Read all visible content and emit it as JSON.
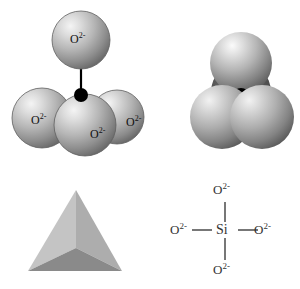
{
  "figure": {
    "width": 300,
    "height": 289,
    "background_color": "#ffffff"
  },
  "colors": {
    "sphere_highlight": "#f0f0f0",
    "sphere_mid": "#b8b8b8",
    "sphere_edge": "#6e6e6e",
    "sphere_outline": "#5a5a5a",
    "silicon_dot": "#000000",
    "bond_line": "#000000",
    "tetra_face_left": "#c4c4c4",
    "tetra_face_right": "#b0b0b0",
    "tetra_face_front": "#8a8a8a",
    "lewis_line": "#555555",
    "lewis_text": "#333333",
    "atom_label_text": "#111111"
  },
  "panels": {
    "ball_and_stick": {
      "name": "ball-and-stick model",
      "center_atom": "Si",
      "atoms": [
        {
          "id": "o-top",
          "label": "O",
          "charge": "2-",
          "cx": 81,
          "cy": 40,
          "r": 29
        },
        {
          "id": "o-left",
          "label": "O",
          "charge": "2-",
          "cx": 42,
          "cy": 118,
          "r": 30
        },
        {
          "id": "o-right",
          "label": "O",
          "charge": "2-",
          "cx": 117,
          "cy": 117,
          "r": 27
        },
        {
          "id": "o-front",
          "label": "O",
          "charge": "2-",
          "cx": 85,
          "cy": 125,
          "r": 31
        }
      ],
      "silicon": {
        "cx": 81,
        "cy": 95,
        "r": 7
      },
      "bond_count": 4
    },
    "space_filling": {
      "name": "space-filling model",
      "atoms": [
        {
          "id": "sf-top",
          "cx": 91,
          "cy": 63,
          "r": 31
        },
        {
          "id": "sf-left",
          "cx": 72,
          "cy": 117,
          "r": 32
        },
        {
          "id": "sf-right",
          "cx": 112,
          "cy": 117,
          "r": 32
        }
      ],
      "silicon": {
        "cx": 91,
        "cy": 96,
        "r": 8
      }
    },
    "tetrahedron": {
      "name": "solid tetrahedron",
      "apex": {
        "x": 76,
        "y": 20
      },
      "bottom_left": {
        "x": 28,
        "y": 101
      },
      "bottom_right": {
        "x": 122,
        "y": 101
      },
      "front_vertex": {
        "x": 76,
        "y": 78
      }
    },
    "lewis": {
      "name": "lewis structure",
      "center": {
        "label": "Si"
      },
      "ligands": [
        {
          "position": "top",
          "label": "O",
          "charge": "2-"
        },
        {
          "position": "left",
          "label": "O",
          "charge": "2-"
        },
        {
          "position": "right",
          "label": "O",
          "charge": "2-"
        },
        {
          "position": "bottom",
          "label": "O",
          "charge": "2-"
        }
      ]
    }
  }
}
